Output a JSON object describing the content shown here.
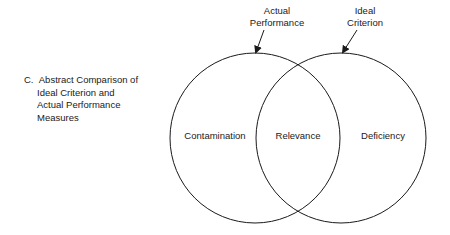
{
  "caption": {
    "letter": "C.",
    "lines": [
      "Abstract Comparison of",
      "Ideal Criterion and",
      "Actual Performance",
      "Measures"
    ]
  },
  "circles": {
    "left": {
      "label_top": [
        "Actual",
        "Performance"
      ],
      "region_label": "Contamination"
    },
    "right": {
      "label_top": [
        "Ideal",
        "Criterion"
      ],
      "region_label": "Deficiency"
    },
    "overlap": {
      "region_label": "Relevance"
    }
  },
  "colors": {
    "stroke": "#1a1a1a",
    "background": "#ffffff"
  }
}
